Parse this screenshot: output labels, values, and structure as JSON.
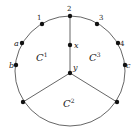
{
  "diagram": {
    "circle": {
      "cx": 70,
      "cy": 71,
      "r": 55,
      "stroke": "#555555"
    },
    "nodes": [
      {
        "id": "2",
        "label": "2",
        "x": 70,
        "y": 16,
        "lx": 67,
        "ly": 11
      },
      {
        "id": "1",
        "label": "1",
        "x": 42,
        "y": 24,
        "lx": 37,
        "ly": 20
      },
      {
        "id": "3",
        "label": "3",
        "x": 97,
        "y": 24,
        "lx": 99,
        "ly": 20
      },
      {
        "id": "a",
        "label": "a",
        "x": 22,
        "y": 43,
        "lx": 14,
        "ly": 46
      },
      {
        "id": "4",
        "label": "4",
        "x": 118,
        "y": 43,
        "lx": 120,
        "ly": 46
      },
      {
        "id": "b",
        "label": "b",
        "x": 16,
        "y": 65,
        "lx": 9,
        "ly": 68
      },
      {
        "id": "c",
        "label": "c",
        "x": 125,
        "y": 65,
        "lx": 126,
        "ly": 68
      },
      {
        "id": "x",
        "label": "x",
        "x": 70,
        "y": 45,
        "lx": 74,
        "ly": 48
      },
      {
        "id": "y",
        "label": "y",
        "x": 70,
        "y": 73,
        "lx": 73,
        "ly": 70
      },
      {
        "id": "bl",
        "label": "",
        "x": 23,
        "y": 102,
        "lx": 0,
        "ly": 0
      },
      {
        "id": "br",
        "label": "",
        "x": 117,
        "y": 102,
        "lx": 0,
        "ly": 0
      }
    ],
    "edges": [
      {
        "from": "2",
        "to": "x"
      },
      {
        "from": "x",
        "to": "y"
      },
      {
        "from": "y",
        "to": "bl"
      },
      {
        "from": "y",
        "to": "br"
      }
    ],
    "regions": [
      {
        "name": "C",
        "sup": "1",
        "x": 36,
        "y": 61
      },
      {
        "name": "C",
        "sup": "3",
        "x": 89,
        "y": 61
      },
      {
        "name": "C",
        "sup": "2",
        "x": 63,
        "y": 107
      }
    ]
  }
}
